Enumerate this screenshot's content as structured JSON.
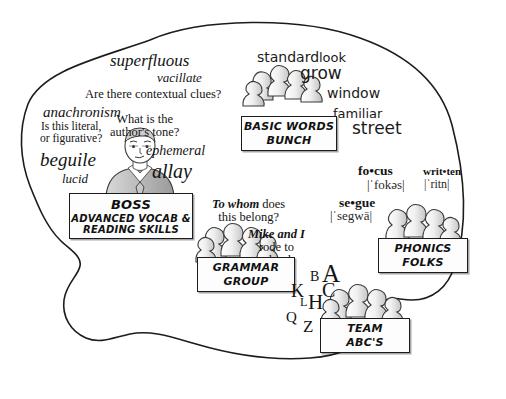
{
  "diagram": {
    "shape": "brain-outline",
    "background_color": "#ffffff",
    "outline_color": "#1c1c1c"
  },
  "boss": {
    "sign_title": "BOSS",
    "sign_subtitle": "ADVANCED VOCAB &\nREADING SKILLS",
    "sign_subtitle_line1": "ADVANCED VOCAB &",
    "sign_subtitle_line2": "READING SKILLS",
    "figure": "business-person-in-suit",
    "vocab_words": [
      "superfluous",
      "vacillate",
      "anachronism",
      "beguile",
      "lucid",
      "ephemeral",
      "allay"
    ],
    "questions": [
      "Are there contextual clues?",
      "What is the",
      "author's tone?",
      "Is this literal,",
      "or figurative?"
    ],
    "q_contextual": "Are there contextual clues?",
    "q_tone_line1": "What is the",
    "q_tone_line2": "author's tone?",
    "q_literal_line1": "Is this literal,",
    "q_literal_line2": "or figurative?"
  },
  "basic_words": {
    "sign_line1": "BASIC WORDS",
    "sign_line2": "BUNCH",
    "words": [
      "standard",
      "look",
      "grow",
      "window",
      "familiar",
      "street"
    ]
  },
  "grammar": {
    "sign_line1": "GRAMMAR",
    "sign_line2": "GROUP",
    "example1_bold": "To whom",
    "example1_rest": " does",
    "example1_line2": "this belong?",
    "example2_bold": "Mike and I",
    "example2_line2": "rode to",
    "example2_line3": "school."
  },
  "phonics": {
    "sign_line1": "PHONICS",
    "sign_line2": "FOLKS",
    "entries": [
      {
        "word": "fo•cus",
        "ipa": "|ˈfokəs|"
      },
      {
        "word": "writ•ten",
        "ipa": "|ˈritn|"
      },
      {
        "word": "se•gue",
        "ipa": "|ˈsegwā|"
      }
    ]
  },
  "abc": {
    "sign_line1": "TEAM",
    "sign_line2": "ABC'S",
    "letters": [
      "A",
      "B",
      "C",
      "K",
      "L",
      "H",
      "Q",
      "Z"
    ]
  }
}
